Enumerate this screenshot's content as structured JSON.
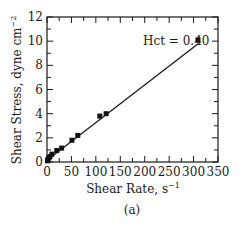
{
  "chart_data": {
    "type": "scatter",
    "title": "",
    "xlabel": "Shear Rate, s",
    "xlabel_sup": "−1",
    "ylabel": "Shear Stress, dyne cm",
    "ylabel_sup": "−2",
    "xlim": [
      0,
      350
    ],
    "ylim": [
      0,
      12
    ],
    "xticks": [
      0,
      50,
      100,
      150,
      200,
      250,
      300,
      350
    ],
    "yticks": [
      0,
      2,
      4,
      6,
      8,
      10,
      12
    ],
    "grid": false,
    "annotation": "Hct = 0.40",
    "caption": "(a)",
    "series": [
      {
        "name": "Measured",
        "marker": "square",
        "x": [
          1,
          2,
          4,
          6,
          10,
          20,
          30,
          51,
          63,
          108,
          121,
          309
        ],
        "y": [
          0.1,
          0.2,
          0.35,
          0.45,
          0.65,
          0.95,
          1.15,
          1.8,
          2.2,
          3.8,
          4.0,
          10.1
        ]
      }
    ],
    "fit_line": {
      "name": "Linear fit",
      "x": [
        0,
        310
      ],
      "y": [
        0.15,
        9.8
      ]
    }
  }
}
